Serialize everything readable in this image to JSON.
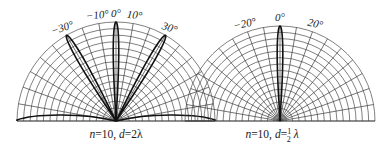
{
  "figure": {
    "width": 391,
    "height": 152,
    "background": "#ffffff",
    "grid_color": "#4a4a4a",
    "lobe_color": "#111111"
  },
  "panels": [
    {
      "id": "left",
      "caption": "n=10, d=2λ",
      "caption_parts": {
        "n": "n",
        "n_val": "=10, ",
        "d": "d",
        "d_val": "=2λ"
      },
      "center": [
        116,
        121
      ],
      "radius": 99,
      "ring_count": 15,
      "radial_step_deg": 10,
      "angle_labels": [
        {
          "text": "−30°",
          "angle": -30
        },
        {
          "text": "−10°",
          "angle": -10
        },
        {
          "text": "0°",
          "angle": 0
        },
        {
          "text": "10°",
          "angle": 10
        },
        {
          "text": "30°",
          "angle": 30
        }
      ],
      "lobes": [
        {
          "angle": 0,
          "length": 1.0,
          "half_width_deg": 3.2
        },
        {
          "angle": -30,
          "length": 1.0,
          "half_width_deg": 3.6
        },
        {
          "angle": 30,
          "length": 1.0,
          "half_width_deg": 3.6
        },
        {
          "angle": -90,
          "length": 1.0,
          "half_width_deg": 7,
          "endfire": true
        },
        {
          "angle": 90,
          "length": 1.0,
          "half_width_deg": 7,
          "endfire": true
        }
      ]
    },
    {
      "id": "right",
      "caption": "n=10, d=½ λ",
      "caption_parts": {
        "n": "n",
        "n_val": "=10, ",
        "d": "d",
        "d_val": "=",
        "frac_num": "1",
        "frac_den": "2",
        "lambda": "λ"
      },
      "center": [
        280,
        121
      ],
      "radius": 95,
      "ring_count": 15,
      "radial_step_deg": 10,
      "angle_labels": [
        {
          "text": "−20°",
          "angle": -20
        },
        {
          "text": "0°",
          "angle": 0
        },
        {
          "text": "20°",
          "angle": 20
        }
      ],
      "lobes": [
        {
          "angle": 0,
          "length": 1.0,
          "half_width_deg": 3.4
        }
      ]
    }
  ]
}
